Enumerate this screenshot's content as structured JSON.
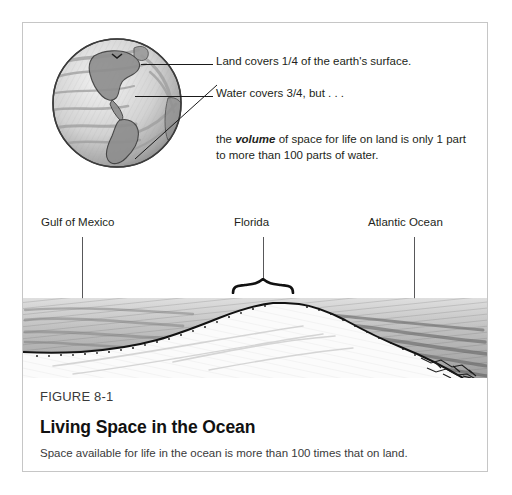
{
  "figure": {
    "number": "FIGURE 8-1",
    "title": "Living Space in the Ocean",
    "description": "Space available for life in the ocean is more than 100 times that on land."
  },
  "globe_callouts": {
    "land": "Land covers 1/4 of the earth's surface.",
    "water": "Water covers 3/4, but . . .",
    "volume_prefix": "the ",
    "volume_emphasis": "volume",
    "volume_suffix": " of space for life on land is only 1 part to more than 100 parts of water."
  },
  "cross_section_labels": {
    "left": "Gulf of Mexico",
    "center": "Florida",
    "right": "Atlantic Ocean"
  },
  "colors": {
    "frame": "#c6c6c6",
    "page_background": "#ffffff",
    "ink": "#231f20",
    "leader_line": "#1a1a1a",
    "pointer_line": "#58585a",
    "water_shading": "#8f8f8f",
    "seabed_line": "#111111"
  }
}
